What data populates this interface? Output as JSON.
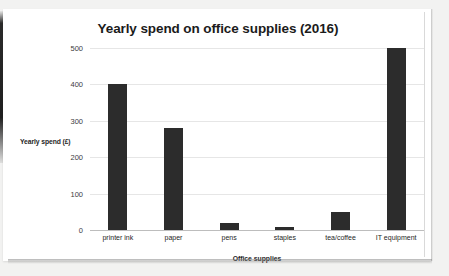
{
  "chart_data": {
    "type": "bar",
    "title": "Yearly spend on office supplies (2016)",
    "xlabel": "Office supplies",
    "ylabel": "Yearly spend (£)",
    "categories": [
      "printer ink",
      "paper",
      "pens",
      "staples",
      "tea/coffee",
      "IT equipment"
    ],
    "values": [
      400,
      280,
      18,
      8,
      50,
      500
    ],
    "ylim": [
      0,
      500
    ],
    "yticks": [
      0,
      100,
      200,
      300,
      400,
      500
    ],
    "ytick_labels": [
      "0",
      "100",
      "200",
      "300",
      "400",
      "500"
    ],
    "grid": true,
    "legend": false,
    "bar_color": "#2c2c2c",
    "gridline_color": "#e6e6e6",
    "plot_background": "#ffffff"
  }
}
